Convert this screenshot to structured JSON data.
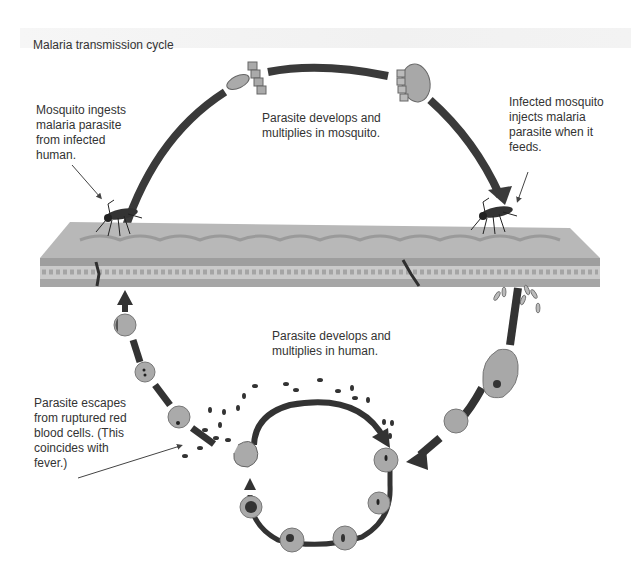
{
  "title": "Malaria transmission cycle",
  "labels": {
    "mosquito_ingests": "Mosquito ingests\nmalaria parasite\nfrom infected\nhuman.",
    "develops_in_mosquito": "Parasite develops and\nmultiplies in mosquito.",
    "infected_mosquito_injects": "Infected mosquito\ninjects malaria\nparasite when it\nfeeds.",
    "develops_in_human": "Parasite develops and\nmultiplies in human.",
    "parasite_escapes": "Parasite escapes\nfrom ruptured red\nblood cells. (This\ncoincides with\nfever.)"
  },
  "colors": {
    "arrow": "#3a3a3a",
    "cell_fill": "#a9a9a9",
    "cell_stroke": "#6e6e6e",
    "skin_top": "#b4b4b4",
    "skin_layer": "#9c9c9c",
    "fat_layer": "#c9c9c9"
  }
}
